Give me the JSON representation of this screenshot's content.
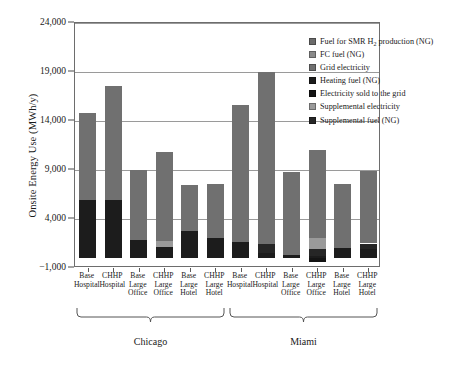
{
  "chart_data": {
    "type": "bar",
    "stacked": true,
    "title": "",
    "xlabel": "",
    "ylabel": "Onsite Energy Use (MWh/y)",
    "ylim": [
      -1000,
      24000
    ],
    "yticks": [
      -1000,
      4000,
      9000,
      14000,
      19000,
      24000
    ],
    "ytick_labels": [
      "−1,000",
      "4,000",
      "9,000",
      "14,000",
      "19,000",
      "24,000"
    ],
    "grid": true,
    "legend_position": "top-right",
    "groups": [
      {
        "name": "Chicago",
        "start": 0,
        "end": 5
      },
      {
        "name": "Miami",
        "start": 6,
        "end": 11
      }
    ],
    "categories": [
      "Base\nHospital",
      "CHHP\nHospital",
      "Base\nLarge\nOffice",
      "CHHP\nLarge\nOffice",
      "Base\nLarge\nHotel",
      "CHHP\nLarge\nHotel",
      "Base\nHospital",
      "CHHP\nHospital",
      "Base\nLarge\nOffice",
      "CHHP\nLarge\nOffice",
      "Base\nLarge\nHotel",
      "CHHP\nLarge\nHotel"
    ],
    "series": [
      {
        "name": "Fuel for SMR H₂ production (NG)",
        "color": "#6b6b6b",
        "values": [
          0,
          0,
          0,
          0,
          0,
          0,
          0,
          0,
          0,
          0,
          0,
          0
        ]
      },
      {
        "name": "FC fuel (NG)",
        "color": "#8a8a8a",
        "values": [
          0,
          0,
          0,
          0,
          0,
          0,
          0,
          0,
          0,
          0,
          0,
          0
        ]
      },
      {
        "name": "Grid electricity",
        "color": "#707070",
        "values": [
          8900,
          11700,
          7100,
          9000,
          4700,
          5500,
          13900,
          17600,
          8500,
          8900,
          6600,
          7400
        ]
      },
      {
        "name": "Heating fuel (NG)",
        "color": "#1c1c1c",
        "values": [
          5900,
          5900,
          1900,
          1100,
          2800,
          2100,
          1700,
          500,
          300,
          200,
          1000,
          900
        ]
      },
      {
        "name": "Electricity sold to the grid",
        "color": "#141414",
        "values": [
          0,
          0,
          0,
          0,
          0,
          0,
          0,
          0,
          0,
          -400,
          0,
          0
        ]
      },
      {
        "name": "Supplemental electricity",
        "color": "#9a9a9a",
        "values": [
          0,
          0,
          0,
          700,
          0,
          0,
          0,
          0,
          0,
          1200,
          0,
          0
        ]
      },
      {
        "name": "Supplemental fuel (NG)",
        "color": "#262626",
        "values": [
          0,
          0,
          0,
          0,
          0,
          0,
          0,
          900,
          0,
          700,
          0,
          600
        ]
      }
    ],
    "bar_totals": [
      14800,
      17600,
      9000,
      10800,
      7500,
      7600,
      15600,
      19000,
      8800,
      11500,
      7600,
      8900
    ]
  },
  "legend": {
    "items": [
      {
        "label": "Fuel for SMR H",
        "sub": "2",
        "label_tail": " production (NG)",
        "color": "#6b6b6b",
        "icon": "legend-swatch"
      },
      {
        "label": "FC fuel (NG)",
        "sub": "",
        "label_tail": "",
        "color": "#8a8a8a",
        "icon": "legend-swatch"
      },
      {
        "label": "Grid electricity",
        "sub": "",
        "label_tail": "",
        "color": "#707070",
        "icon": "legend-swatch"
      },
      {
        "label": "Heating fuel (NG)",
        "sub": "",
        "label_tail": "",
        "color": "#1c1c1c",
        "icon": "legend-swatch"
      },
      {
        "label": "Electricity sold to the grid",
        "sub": "",
        "label_tail": "",
        "color": "#141414",
        "icon": "legend-swatch"
      },
      {
        "label": "Supplemental electricity",
        "sub": "",
        "label_tail": "",
        "color": "#9a9a9a",
        "icon": "legend-swatch"
      },
      {
        "label": "Supplemental fuel (NG)",
        "sub": "",
        "label_tail": "",
        "color": "#262626",
        "icon": "legend-swatch"
      }
    ]
  }
}
